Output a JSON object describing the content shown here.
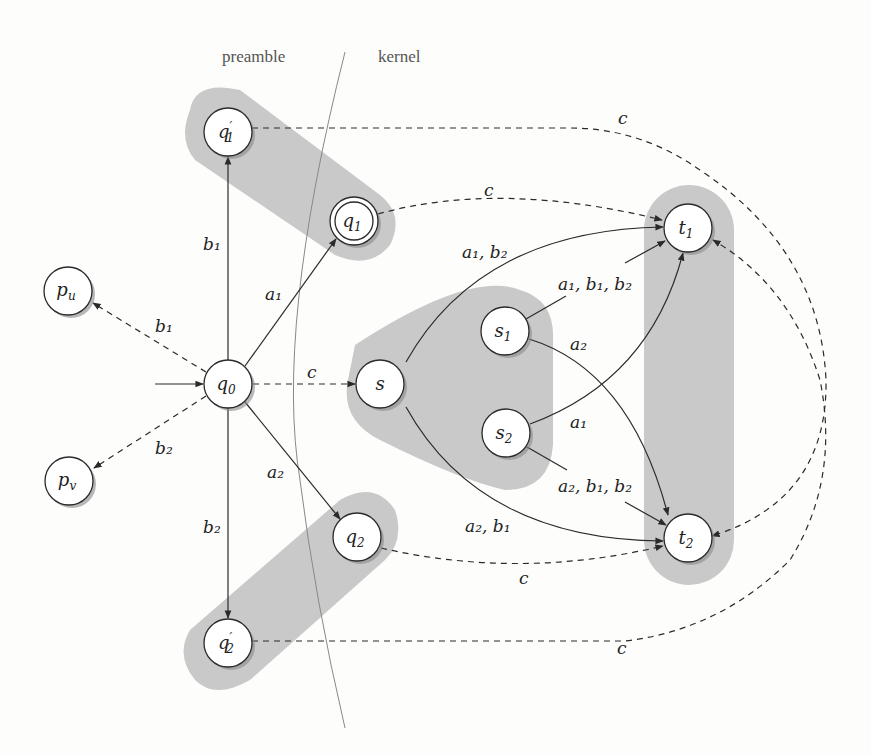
{
  "regions": {
    "preamble_label": "preamble",
    "kernel_label": "kernel"
  },
  "colors": {
    "background": "#fdfdfc",
    "group_fill": "#c9c9c9",
    "node_fill": "#ffffff",
    "stroke": "#2a2a2a",
    "shadow": "#8a8a8a"
  },
  "nodes": {
    "q1p": {
      "label": "q",
      "sub": "1",
      "prime": "′"
    },
    "q1": {
      "label": "q",
      "sub": "1",
      "accepting": true
    },
    "q0": {
      "label": "q",
      "sub": "0",
      "initial": true
    },
    "pu": {
      "label": "p",
      "sub": "u"
    },
    "pv": {
      "label": "p",
      "sub": "v"
    },
    "s": {
      "label": "s",
      "sub": ""
    },
    "s1": {
      "label": "s",
      "sub": "1"
    },
    "s2": {
      "label": "s",
      "sub": "2"
    },
    "t1": {
      "label": "t",
      "sub": "1"
    },
    "t2": {
      "label": "t",
      "sub": "2"
    },
    "q2": {
      "label": "q",
      "sub": "2"
    },
    "q2p": {
      "label": "q",
      "sub": "2",
      "prime": "′"
    }
  },
  "edge_labels": {
    "q0_q1p": "b₁",
    "q0_q1": "a₁",
    "q0_pu": "b₁",
    "q0_pv": "b₂",
    "q0_s": "c",
    "q0_q2": "a₂",
    "q0_q2p": "b₂",
    "q1p_t2": "c",
    "q1_t1": "c",
    "s_t1": "a₁, b₂",
    "s1_t1": "a₁, b₁, b₂",
    "s1_t2": "a₂",
    "s2_t1": "a₁",
    "s2_t2": "a₂, b₁, b₂",
    "s_t2": "a₂, b₁",
    "q2_t2": "c",
    "q2p_t1": "c"
  }
}
